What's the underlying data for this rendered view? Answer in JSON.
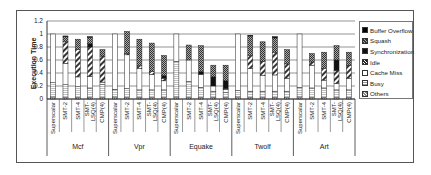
{
  "chart_data": {
    "type": "bar",
    "stacked": true,
    "title": "",
    "xlabel": "",
    "ylabel": "Execution Time",
    "ylim": [
      0,
      1.2
    ],
    "yticks": [
      "0",
      "0.2",
      "0.4",
      "0.6",
      "0.8",
      "1",
      "1.2"
    ],
    "grid": true,
    "legend_position": "right",
    "groups": [
      "Mcf",
      "Vpr",
      "Equake",
      "Twolf",
      "Art"
    ],
    "configs": [
      "Superscalar",
      "SMT-2",
      "SMT-4",
      "SMT-LSQ(4)",
      "CMP(4)"
    ],
    "config_labels": [
      "Superscalar",
      "SMT-2",
      "SMT-4",
      "SMT-\nLSQ(4)",
      "CMP(4)"
    ],
    "legend": [
      "Buffer Overflow",
      "Squash",
      "Synchronization",
      "Idle",
      "Cache Miss",
      "Busy",
      "Others"
    ],
    "series": [
      {
        "name": "Others",
        "values": [
          0.03,
          0.02,
          0.02,
          0.02,
          0.02,
          0.03,
          0.02,
          0.02,
          0.02,
          0.02,
          0.03,
          0.02,
          0.02,
          0.02,
          0.02,
          0.03,
          0.02,
          0.02,
          0.02,
          0.02,
          0.03,
          0.02,
          0.02,
          0.02,
          0.02
        ]
      },
      {
        "name": "Busy",
        "values": [
          0.22,
          0.2,
          0.17,
          0.15,
          0.2,
          0.12,
          0.14,
          0.12,
          0.12,
          0.12,
          0.55,
          0.25,
          0.16,
          0.1,
          0.08,
          0.1,
          0.1,
          0.1,
          0.1,
          0.1,
          0.15,
          0.15,
          0.15,
          0.12,
          0.12
        ]
      },
      {
        "name": "Cache Miss",
        "values": [
          0.75,
          0.33,
          0.15,
          0.18,
          0.04,
          0.85,
          0.52,
          0.33,
          0.24,
          0.14,
          0.42,
          0.33,
          0.2,
          0.08,
          0.05,
          0.87,
          0.35,
          0.24,
          0.25,
          0.2,
          0.82,
          0.35,
          0.12,
          0.1,
          0.18
        ]
      },
      {
        "name": "Idle",
        "values": [
          0,
          0.33,
          0.42,
          0.45,
          0.4,
          0,
          0.02,
          0.04,
          0.04,
          0.04,
          0,
          0,
          0,
          0,
          0.01,
          0,
          0.2,
          0.22,
          0.35,
          0.22,
          0,
          0.05,
          0.18,
          0.2,
          0.2
        ]
      },
      {
        "name": "Synchronization",
        "values": [
          0,
          0,
          0,
          0.05,
          0,
          0,
          0,
          0,
          0,
          0.04,
          0,
          0,
          0.04,
          0.14,
          0.12,
          0,
          0,
          0,
          0,
          0,
          0,
          0,
          0,
          0.16,
          0
        ]
      },
      {
        "name": "Squash",
        "values": [
          0,
          0.08,
          0.16,
          0.1,
          0.1,
          0,
          0.34,
          0.41,
          0.44,
          0.31,
          0,
          0.23,
          0.4,
          0.18,
          0.24,
          0,
          0.3,
          0.3,
          0.22,
          0.22,
          0,
          0.13,
          0.25,
          0.22,
          0.2
        ]
      },
      {
        "name": "Buffer Overflow",
        "values": [
          0,
          0.01,
          0,
          0.01,
          0,
          0,
          0,
          0,
          0,
          0,
          0,
          0,
          0,
          0,
          0,
          0,
          0.01,
          0,
          0.02,
          0,
          0,
          0,
          0,
          0,
          0
        ]
      }
    ],
    "totals": [
      1.0,
      0.97,
      0.92,
      0.96,
      0.76,
      1.0,
      1.04,
      0.92,
      0.86,
      0.67,
      1.0,
      0.83,
      0.82,
      0.52,
      0.52,
      1.0,
      0.98,
      0.88,
      0.96,
      0.76,
      1.0,
      0.7,
      0.72,
      0.84,
      0.72
    ]
  },
  "legend_swatches": {
    "Buffer Overflow": "#111111",
    "Squash": "#666666",
    "Synchronization": "#000000",
    "Idle": "#444444",
    "Cache Miss": "#ffffff",
    "Busy": "#f2f2f2",
    "Others": "#cccccc"
  }
}
